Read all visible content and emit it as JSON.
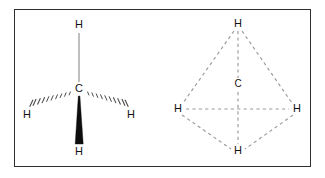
{
  "figure": {
    "background_color": "#ffffff",
    "border_color": "#2e2e2e"
  },
  "panels": [
    {
      "id": "lewis",
      "name": "wedge-dash-structure",
      "description": "Tetrahedral methane drawn with wedge and hash bonds",
      "center_atom": {
        "label": "C",
        "x": 79,
        "y": 89
      },
      "atoms": [
        {
          "label": "H",
          "x": 79,
          "y": 25,
          "position": "top"
        },
        {
          "label": "H",
          "x": 27,
          "y": 115,
          "position": "left"
        },
        {
          "label": "H",
          "x": 131,
          "y": 115,
          "position": "right"
        },
        {
          "label": "H",
          "x": 79,
          "y": 152,
          "position": "bottom"
        }
      ],
      "bonds": [
        {
          "type": "plain",
          "from": "C",
          "to": "H-top",
          "color": "#8a8a8a"
        },
        {
          "type": "hashed",
          "from": "C",
          "to": "H-left",
          "color": "#4a4a4a"
        },
        {
          "type": "hashed",
          "from": "C",
          "to": "H-right",
          "color": "#4a4a4a"
        },
        {
          "type": "wedge",
          "from": "C",
          "to": "H-bottom",
          "color": "#0d0d0d"
        }
      ]
    },
    {
      "id": "tetrahedron",
      "name": "tetrahedron-structure",
      "description": "Methane shown as a dashed tetrahedron with carbon at the center",
      "center_atom": {
        "label": "C",
        "x": 238,
        "y": 85
      },
      "atoms": [
        {
          "label": "H",
          "x": 238,
          "y": 24,
          "position": "apex"
        },
        {
          "label": "H",
          "x": 178,
          "y": 109,
          "position": "left"
        },
        {
          "label": "H",
          "x": 297,
          "y": 109,
          "position": "right"
        },
        {
          "label": "H",
          "x": 238,
          "y": 151,
          "position": "front"
        }
      ],
      "bonds": [
        {
          "type": "dashed",
          "from": "H-apex",
          "to": "H-left",
          "color": "#9a9a9a"
        },
        {
          "type": "dashed",
          "from": "H-apex",
          "to": "H-right",
          "color": "#9a9a9a"
        },
        {
          "type": "dashed",
          "from": "H-apex",
          "to": "H-front",
          "color": "#9a9a9a"
        },
        {
          "type": "dashed",
          "from": "H-left",
          "to": "H-right",
          "color": "#9a9a9a"
        },
        {
          "type": "dashed",
          "from": "H-left",
          "to": "H-front",
          "color": "#9a9a9a"
        },
        {
          "type": "dashed",
          "from": "H-right",
          "to": "H-front",
          "color": "#9a9a9a"
        }
      ]
    }
  ],
  "labels": {
    "carbon": "C",
    "hydrogen": "H"
  }
}
